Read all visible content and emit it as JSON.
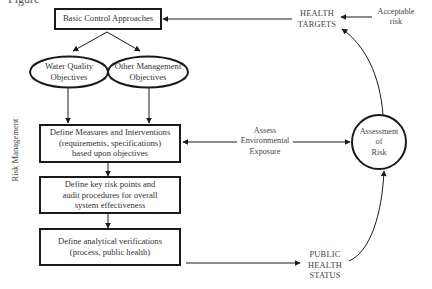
{
  "caption": {
    "partial_text": "Figure"
  },
  "side_label": "Risk Management",
  "nodes": {
    "basic_control": "Basic Control Approaches",
    "water_quality": [
      "Water Quality",
      "Objectives"
    ],
    "other_management": [
      "Other Management",
      "Objectives"
    ],
    "define_measures": [
      "Define Measures and Interventions",
      "(requirements, specifications)",
      "based upon objectives"
    ],
    "define_risk_points": [
      "Define key risk points and",
      "audit procedures for overall",
      "system effectiveness"
    ],
    "define_verifications": [
      "Define analytical verifications",
      "(process, public health)"
    ],
    "assessment_of_risk": [
      "Assessment",
      "of",
      "Risk"
    ],
    "health_targets": [
      "HEALTH",
      "TARGETS"
    ],
    "acceptable_risk": [
      "Acceptable",
      "risk"
    ],
    "public_health_status": [
      "PUBLIC",
      "HEALTH",
      "STATUS"
    ],
    "assess_exposure": [
      "Assess",
      "Environmental",
      "Exposure"
    ]
  },
  "colors": {
    "stroke": "#1a1a1a",
    "text": "#333333",
    "background": "#ffffff"
  }
}
